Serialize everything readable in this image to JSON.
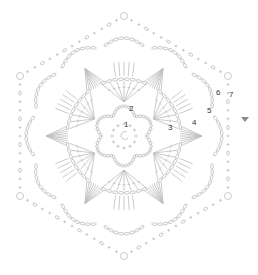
{
  "diagram": {
    "type": "crochet-chart",
    "shape": "hexagon-motif",
    "center": [
      124,
      136
    ],
    "line_color": "#bdbdbd",
    "label_color": "#333333",
    "marker_color": "#8a8a8a",
    "round_labels": [
      {
        "text": "1",
        "x": 124,
        "y": 127
      },
      {
        "text": "2",
        "x": 129,
        "y": 111
      },
      {
        "text": "3",
        "x": 168,
        "y": 130
      },
      {
        "text": "4",
        "x": 192,
        "y": 125
      },
      {
        "text": "5",
        "x": 207,
        "y": 113
      },
      {
        "text": "6",
        "x": 216,
        "y": 95
      },
      {
        "text": "7",
        "x": 229,
        "y": 97
      }
    ],
    "start_marker": {
      "symbol": "triangle",
      "x": 245,
      "y": 120
    }
  }
}
